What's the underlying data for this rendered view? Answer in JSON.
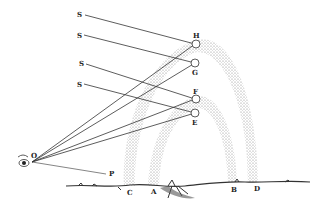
{
  "figure": {
    "colors": {
      "ink": "#222222",
      "band": "#bdbdbd",
      "background": "#ffffff"
    },
    "labels": {
      "sun_rays": [
        "S",
        "S",
        "S",
        "S"
      ],
      "droplets": {
        "h": "H",
        "g": "G",
        "f": "F",
        "e": "E"
      },
      "eye": "O",
      "horizon_point": "P",
      "ground": {
        "c": "C",
        "a": "A",
        "b": "B",
        "d": "D"
      }
    },
    "bows": [
      {
        "name": "secondary (outer) bow",
        "feet": [
          "C",
          "D"
        ]
      },
      {
        "name": "primary (inner) bow",
        "feet": [
          "A",
          "B"
        ]
      }
    ]
  }
}
